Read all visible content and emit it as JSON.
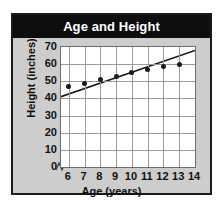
{
  "chart_data": {
    "type": "scatter",
    "title": "Age and Height",
    "xlabel": "Age (years)",
    "ylabel": "Height (inches)",
    "xlim": [
      5.5,
      14
    ],
    "ylim": [
      0,
      70
    ],
    "x_ticks": [
      6,
      7,
      8,
      9,
      10,
      11,
      12,
      13,
      14
    ],
    "y_ticks": [
      0,
      10,
      20,
      30,
      40,
      50,
      60,
      70
    ],
    "grid": true,
    "legend": "none",
    "y_axis_break": true,
    "x": [
      6,
      7,
      8,
      9,
      10,
      11,
      12,
      13
    ],
    "values": [
      47,
      49,
      51,
      53,
      55,
      57,
      58.5,
      60
    ],
    "series": [
      {
        "name": "Height vs Age",
        "x": [
          6,
          7,
          8,
          9,
          10,
          11,
          12,
          13
        ],
        "values": [
          47,
          49,
          51,
          53,
          55,
          57,
          58.5,
          60
        ],
        "marker": "filled-circle",
        "color": "#1a1a1a"
      },
      {
        "name": "Trend line",
        "type": "line",
        "x": [
          5.5,
          14
        ],
        "values": [
          41,
          68
        ],
        "color": "#1a1a1a"
      }
    ],
    "annotations": []
  },
  "colors": {
    "banner_background": "#0d0d0d",
    "banner_text": "#ffffff",
    "panel_background": "#cdcdcd",
    "plot_background": "#ffffff",
    "grid": "#9a9a9a",
    "frame": "#1a1a1a",
    "marker": "#1a1a1a",
    "trendline": "#1a1a1a"
  }
}
